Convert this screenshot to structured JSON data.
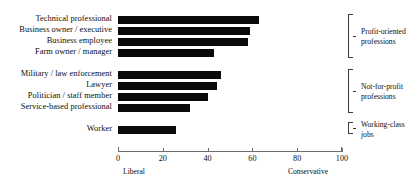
{
  "chart_data": {
    "type": "bar",
    "orientation": "horizontal",
    "title": "",
    "subtitle": "",
    "xlabel": "",
    "ylabel": "",
    "xlim": [
      0,
      100
    ],
    "grid": false,
    "legend": "none",
    "axis_end_captions": {
      "left": "Liberal",
      "right": "Conservative"
    },
    "xticks": [
      0,
      20,
      40,
      60,
      80,
      100
    ],
    "xtick_labels": [
      "0",
      "20",
      "40",
      "60",
      "80",
      "100"
    ],
    "categories": [
      "Technical professional",
      "Business owner / executive",
      "Business employee",
      "Farm owner / manager",
      "Military / law enforcement",
      "Lawyer",
      "Politician / staff member",
      "Service-based professional",
      "Worker"
    ],
    "values": [
      63,
      59,
      58,
      43,
      46,
      44,
      40,
      32,
      26
    ],
    "bar_color": "#0a0a0a",
    "groups": [
      {
        "label": "Profit-oriented professions",
        "label_line1": "Profit-oriented",
        "label_line2": "professions",
        "categories": [
          "Technical professional",
          "Business owner / executive",
          "Business employee",
          "Farm owner / manager"
        ]
      },
      {
        "label": "Not-for-profit professions",
        "label_line1": "Not-for-profit",
        "label_line2": "professions",
        "categories": [
          "Military / law enforcement",
          "Lawyer",
          "Politician / staff member",
          "Service-based professional"
        ]
      },
      {
        "label": "Working-class jobs",
        "label_line1": "Working-class",
        "label_line2": "jobs",
        "categories": [
          "Worker"
        ]
      }
    ]
  },
  "layout": {
    "bars": [
      {
        "label_top": 14,
        "bar_top": 16,
        "value_index": 0
      },
      {
        "label_top": 25,
        "bar_top": 27,
        "value_index": 1
      },
      {
        "label_top": 36,
        "bar_top": 38,
        "value_index": 2
      },
      {
        "label_top": 47,
        "bar_top": 49,
        "value_index": 3
      },
      {
        "label_top": 69,
        "bar_top": 71,
        "value_index": 4
      },
      {
        "label_top": 80,
        "bar_top": 82,
        "value_index": 5
      },
      {
        "label_top": 91,
        "bar_top": 93,
        "value_index": 6
      },
      {
        "label_top": 102,
        "bar_top": 104,
        "value_index": 7
      },
      {
        "label_top": 124,
        "bar_top": 126,
        "value_index": 8
      }
    ],
    "brackets": [
      {
        "top": 14,
        "height": 44,
        "label_top": 26
      },
      {
        "top": 69,
        "height": 44,
        "label_top": 81
      },
      {
        "top": 124,
        "height": 11,
        "label_top": 120
      }
    ]
  }
}
